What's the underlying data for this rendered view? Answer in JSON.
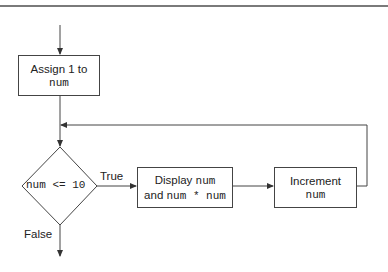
{
  "diagram": {
    "type": "flowchart",
    "nodes": {
      "assign": {
        "line1": "Assign 1 to",
        "line2_code": "num"
      },
      "condition": {
        "code": "num <= 10"
      },
      "display": {
        "line1_text": "Display ",
        "line1_code": "num",
        "line2_text": "and ",
        "line2_code": "num * num"
      },
      "increment": {
        "line1": "Increment",
        "line2_code": "num"
      }
    },
    "edges": {
      "true_label": "True",
      "false_label": "False"
    },
    "colors": {
      "stroke": "#444444",
      "rule": "#7a7a7a"
    }
  }
}
